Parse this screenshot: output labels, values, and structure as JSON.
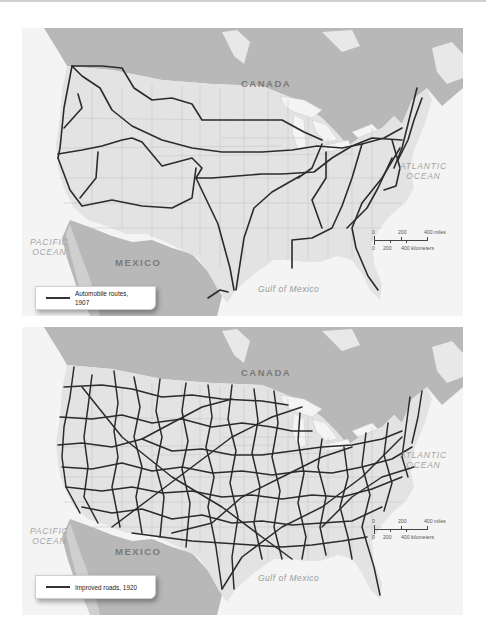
{
  "maps": [
    {
      "id": "map-1907",
      "labels": {
        "canada": "CANADA",
        "mexico": "MEXICO",
        "atlantic_line1": "ATLANTIC",
        "atlantic_line2": "OCEAN",
        "pacific_line1": "PACIFIC",
        "pacific_line2": "OCEAN",
        "gulf": "Gulf of Mexico"
      },
      "legend": {
        "label": "Automobile routes, 1907",
        "line_color": "#333333"
      },
      "scale": {
        "miles_ticks": [
          "0",
          "200",
          "400 miles"
        ],
        "km_ticks": [
          "0",
          "200",
          "400 kilometers"
        ]
      }
    },
    {
      "id": "map-1920",
      "labels": {
        "canada": "CANADA",
        "mexico": "MEXICO",
        "atlantic_line1": "ATLANTIC",
        "atlantic_line2": "OCEAN",
        "pacific_line1": "PACIFIC",
        "pacific_line2": "OCEAN",
        "gulf": "Gulf of Mexico"
      },
      "legend": {
        "label": "Improved roads, 1920",
        "line_color": "#333333"
      },
      "scale": {
        "miles_ticks": [
          "0",
          "200",
          "400 miles"
        ],
        "km_ticks": [
          "0",
          "200",
          "400 kilometers"
        ]
      }
    }
  ],
  "colors": {
    "ocean": "#f4f4f4",
    "us_land": "#e3e3e3",
    "foreign_land": "#b8b8b8",
    "lakes": "#f4f4f4",
    "state_borders": "#c4c4c4",
    "routes": "#2b2b2b"
  }
}
